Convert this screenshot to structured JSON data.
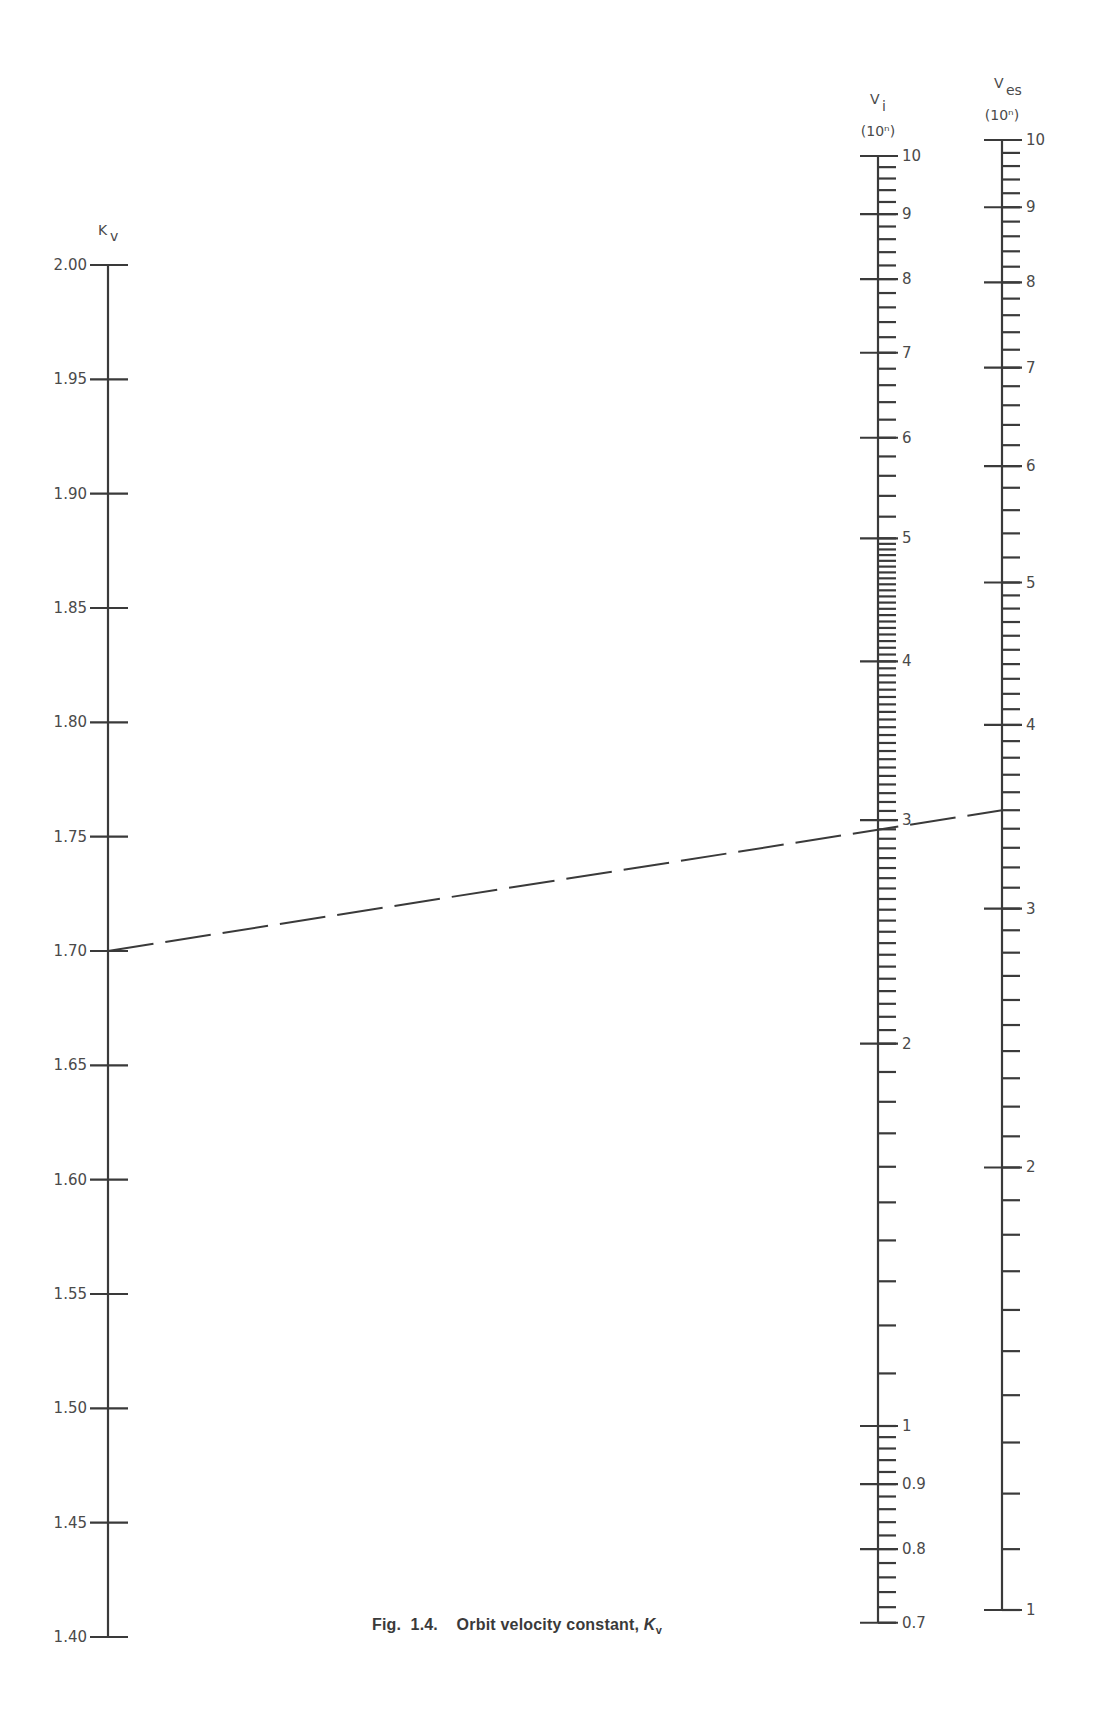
{
  "figure": {
    "caption_prefix": "Fig.  1.4.    Orbit velocity constant, ",
    "caption_symbol": "K",
    "caption_subscript": "v"
  },
  "colors": {
    "ink": "#3a3a3a",
    "background": "#ffffff"
  },
  "chart_data": {
    "type": "nomogram",
    "title": "Orbit velocity constant, Kv",
    "axes": [
      {
        "id": "kv",
        "label": "K",
        "label_sub": "v",
        "unit": "",
        "scale": "linear",
        "range": [
          1.4,
          2.0
        ],
        "major_ticks": [
          "2.00",
          "1.95",
          "1.90",
          "1.85",
          "1.80",
          "1.75",
          "1.70",
          "1.65",
          "1.60",
          "1.55",
          "1.50",
          "1.45",
          "1.40"
        ],
        "label_side": "left",
        "x": 108,
        "y_top": 265,
        "y_bottom": 1637
      },
      {
        "id": "vi",
        "label": "V",
        "label_sub": "i",
        "unit": "(10ⁿ)",
        "scale": "log",
        "range": [
          0.7,
          10
        ],
        "major_ticks": [
          "10",
          "9",
          "8",
          "7",
          "6",
          "5",
          "4",
          "3",
          "2",
          "1",
          "0.9",
          "0.8",
          "0.7"
        ],
        "label_side": "right",
        "x": 878,
        "y_at_1": 1426,
        "px_per_decade": 1270
      },
      {
        "id": "ves",
        "label": "V",
        "label_sub": "es",
        "unit": "(10ⁿ)",
        "scale": "log",
        "range": [
          1,
          10
        ],
        "major_ticks": [
          "10",
          "9",
          "8",
          "7",
          "6",
          "5",
          "4",
          "3",
          "2",
          "1"
        ],
        "label_side": "right",
        "x": 1002,
        "y_at_1": 1610,
        "px_per_decade": 1470
      }
    ],
    "example_isopleth": {
      "style": "dashed",
      "kv": 1.7,
      "vi": 3.0,
      "ves": 3.5
    }
  }
}
